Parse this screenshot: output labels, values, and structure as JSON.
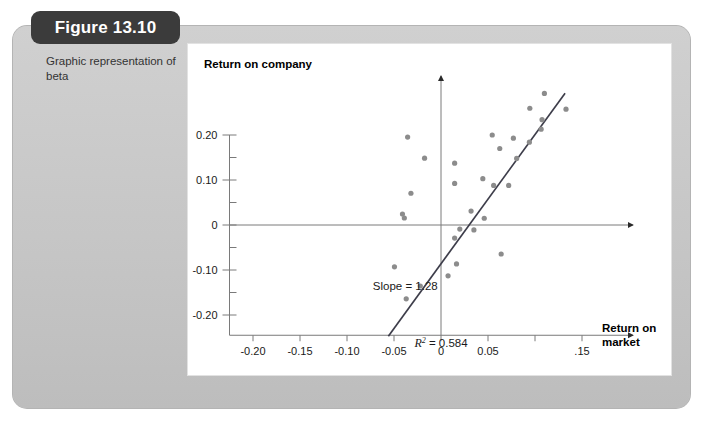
{
  "figure": {
    "tab_label": "Figure 13.10",
    "caption": "Graphic representation of beta",
    "tab_color": "#3b3b3b",
    "panel_color": "#c9c9c9",
    "card_color": "#ffffff"
  },
  "chart_data": {
    "type": "scatter",
    "title": "",
    "xlabel": "Return on market",
    "ylabel": "Return on company",
    "xlim": [
      -0.225,
      0.185
    ],
    "ylim": [
      -0.245,
      0.3
    ],
    "grid": false,
    "legend": "none",
    "point_color": "#8c8c8c",
    "line_color": "#3d3d4a",
    "axis_color": "#7a7a7a",
    "x_ticks": [
      -0.2,
      -0.15,
      -0.1,
      -0.05,
      0,
      0.05,
      0.1,
      0.15
    ],
    "x_tick_labels": [
      "-0.20",
      "-0.15",
      "-0.10",
      "-0.05",
      "0",
      "0.05",
      "",
      ".15"
    ],
    "y_ticks": [
      0.2,
      0.15,
      0.1,
      0.05,
      0,
      -0.05,
      -0.1,
      -0.15,
      -0.2
    ],
    "y_tick_labels": [
      "0.20",
      "",
      "0.10",
      "",
      "0",
      "",
      "-0.10",
      "",
      "-0.20"
    ],
    "annotations": [
      {
        "name": "slope-annotation",
        "text": "Slope  =  1.28",
        "x": -0.038,
        "y": -0.145
      },
      {
        "name": "r-squared-annotation",
        "text_r": "R",
        "text_sup": "2",
        "text_rest": "=  0.584",
        "x": 0.0,
        "y": -0.272
      }
    ],
    "regression_line": {
      "slope": 1.28,
      "r_squared": 0.584,
      "x_start": -0.056,
      "y_start": -0.247,
      "x_end": 0.132,
      "y_end": 0.293
    },
    "points": [
      {
        "x": -0.0355,
        "y": 0.1955
      },
      {
        "x": -0.0175,
        "y": 0.1485
      },
      {
        "x": 0.0145,
        "y": 0.1375
      },
      {
        "x": 0.0145,
        "y": 0.0925
      },
      {
        "x": -0.032,
        "y": 0.0705
      },
      {
        "x": -0.041,
        "y": 0.0245
      },
      {
        "x": -0.039,
        "y": 0.0155
      },
      {
        "x": 0.02,
        "y": -0.009
      },
      {
        "x": 0.035,
        "y": -0.011
      },
      {
        "x": 0.0145,
        "y": -0.029
      },
      {
        "x": 0.064,
        "y": -0.0645
      },
      {
        "x": 0.0165,
        "y": -0.0865
      },
      {
        "x": -0.0495,
        "y": -0.093
      },
      {
        "x": 0.0075,
        "y": -0.113
      },
      {
        "x": -0.022,
        "y": -0.1355
      },
      {
        "x": -0.037,
        "y": -0.164
      },
      {
        "x": 0.11,
        "y": 0.2925
      },
      {
        "x": 0.0945,
        "y": 0.2595
      },
      {
        "x": 0.133,
        "y": 0.2575
      },
      {
        "x": 0.1075,
        "y": 0.234
      },
      {
        "x": 0.1065,
        "y": 0.213
      },
      {
        "x": 0.0545,
        "y": 0.2
      },
      {
        "x": 0.077,
        "y": 0.193
      },
      {
        "x": 0.094,
        "y": 0.184
      },
      {
        "x": 0.0625,
        "y": 0.17
      },
      {
        "x": 0.0805,
        "y": 0.148
      },
      {
        "x": 0.0445,
        "y": 0.103
      },
      {
        "x": 0.056,
        "y": 0.088
      },
      {
        "x": 0.072,
        "y": 0.088
      },
      {
        "x": 0.032,
        "y": 0.031
      },
      {
        "x": 0.046,
        "y": 0.015
      }
    ]
  }
}
